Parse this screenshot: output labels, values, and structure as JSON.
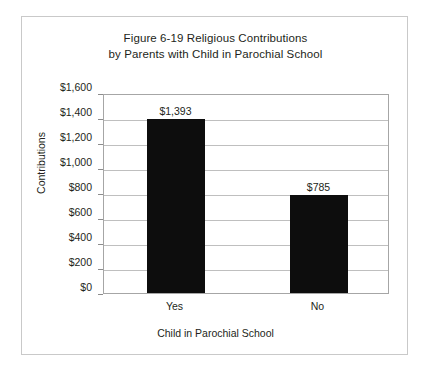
{
  "chart_data": {
    "type": "bar",
    "title": "Figure 6-19 Religious Contributions by Parents with Child in Parochial School",
    "title_lines": [
      "Figure 6-19 Religious Contributions",
      "by Parents with Child in Parochial School"
    ],
    "categories": [
      "Yes",
      "No"
    ],
    "values": [
      1393,
      785
    ],
    "data_labels": [
      "$1,393",
      "$785"
    ],
    "xlabel": "Child in Parochial School",
    "ylabel": "Contributions",
    "ylim": [
      0,
      1600
    ],
    "ytick_step": 200,
    "ytick_labels": [
      "$1,600",
      "$1,400",
      "$1,200",
      "$1,000",
      "$800",
      "$600",
      "$400",
      "$200",
      "$0"
    ],
    "ytick_values": [
      1600,
      1400,
      1200,
      1000,
      800,
      600,
      400,
      200,
      0
    ],
    "grid": true,
    "legend": false,
    "legend_position": "none",
    "bar_color": "#0d0d0d",
    "plot_border_color": "#a6a6a6",
    "gridline_color": "#bfbfbf",
    "frame_color": "#c9c9c9",
    "text_color": "#231f20",
    "background_color": "#ffffff"
  }
}
